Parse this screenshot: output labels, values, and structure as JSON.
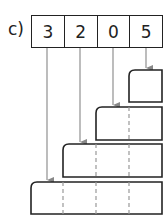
{
  "label": "c)",
  "digits": [
    "3",
    "2",
    "0",
    "5"
  ],
  "colors": {
    "stroke": "#222222",
    "arrow": "#888888",
    "dash": "#999999"
  },
  "boxes": [
    {
      "cells": 1,
      "source_digit": "5"
    },
    {
      "cells": 2,
      "source_digit": "0"
    },
    {
      "cells": 3,
      "source_digit": "2"
    },
    {
      "cells": 4,
      "source_digit": "3"
    }
  ]
}
